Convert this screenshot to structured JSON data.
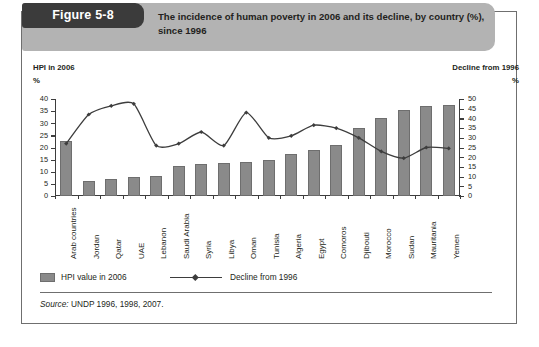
{
  "figure": {
    "badge": "Figure 5-8",
    "title": "The incidence of human poverty in 2006 and its decline, by country (%), since 1996"
  },
  "axes": {
    "left_caption": "HPI in 2006",
    "left_unit": "%",
    "right_caption": "Decline from 1996",
    "right_unit": "%",
    "left_ticks": [
      "0",
      "5",
      "10",
      "15",
      "20",
      "25",
      "30",
      "35",
      "40"
    ],
    "right_ticks": [
      "0",
      "5",
      "10",
      "15",
      "20",
      "25",
      "30",
      "35",
      "40",
      "45",
      "50"
    ]
  },
  "legend": {
    "bar_label": "HPI value in 2006",
    "line_label": "Decline from 1996"
  },
  "source": {
    "prefix": "Source:",
    "text": "UNDP 1996, 1998, 2007."
  },
  "colors": {
    "bar_fill": "#8a8a8a",
    "line_stroke": "#3d3d3d",
    "header_band": "#b3b3b3",
    "badge": "#3b3b3b",
    "frame": "#6f6f6f"
  },
  "chart_data": {
    "type": "bar",
    "title": "The incidence of human poverty in 2006 and its decline, by country (%), since 1996",
    "xlabel": "",
    "ylabel": "HPI in 2006 (%)",
    "y2label": "Decline from 1996 (%)",
    "ylim": [
      0,
      40
    ],
    "y2lim": [
      0,
      50
    ],
    "grid": false,
    "legend_position": "bottom-left",
    "categories": [
      "Arab countries",
      "Jordan",
      "Qatar",
      "UAE",
      "Lebanon",
      "Saudi Arabia",
      "Syria",
      "Libya",
      "Oman",
      "Tunisia",
      "Algeria",
      "Egypt",
      "Comoros",
      "Djibouti",
      "Morocco",
      "Sudan",
      "Mauritania",
      "Yemen"
    ],
    "series": [
      {
        "name": "HPI value in 2006",
        "axis": "left",
        "type": "bar",
        "values": [
          22.5,
          6.0,
          7.0,
          7.8,
          8.3,
          12.5,
          13.0,
          13.5,
          14.0,
          15.0,
          17.5,
          19.0,
          21.0,
          28.0,
          32.0,
          35.5,
          37.0,
          37.5
        ]
      },
      {
        "name": "Decline from 1996",
        "axis": "right",
        "type": "line",
        "values": [
          27.0,
          42.0,
          46.5,
          47.5,
          26.0,
          27.0,
          33.0,
          26.0,
          43.0,
          30.0,
          31.0,
          36.5,
          35.0,
          30.0,
          23.0,
          19.5,
          25.0,
          24.5
        ]
      }
    ]
  }
}
